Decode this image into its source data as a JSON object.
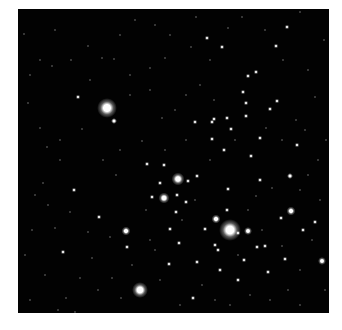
{
  "image": {
    "subject": "star cluster field",
    "background_color": "#020202",
    "frame_color": "#ffffff",
    "field": {
      "x": 18,
      "y": 9,
      "w": 311,
      "h": 304
    },
    "bright_stars": [
      [
        107,
        108,
        20
      ],
      [
        230,
        230,
        22
      ],
      [
        140,
        290,
        16
      ],
      [
        178,
        179,
        13
      ],
      [
        164,
        198,
        11
      ],
      [
        126,
        231,
        9
      ],
      [
        291,
        211,
        9
      ],
      [
        216,
        219,
        9
      ],
      [
        248,
        231,
        8
      ],
      [
        322,
        261,
        8
      ],
      [
        290,
        176,
        6
      ],
      [
        114,
        121,
        6
      ]
    ],
    "medium_stars": [
      [
        243,
        92
      ],
      [
        195,
        122
      ],
      [
        214,
        119
      ],
      [
        227,
        118
      ],
      [
        231,
        129
      ],
      [
        164,
        165
      ],
      [
        212,
        122
      ],
      [
        251,
        156
      ],
      [
        228,
        189
      ],
      [
        265,
        246
      ],
      [
        244,
        260
      ],
      [
        260,
        180
      ],
      [
        147,
        164
      ],
      [
        177,
        195
      ],
      [
        212,
        139
      ],
      [
        186,
        202
      ],
      [
        215,
        245
      ],
      [
        257,
        247
      ],
      [
        238,
        233
      ],
      [
        205,
        229
      ],
      [
        170,
        229
      ],
      [
        193,
        298
      ],
      [
        227,
        210
      ],
      [
        277,
        101
      ],
      [
        270,
        109
      ],
      [
        303,
        230
      ],
      [
        297,
        145
      ],
      [
        152,
        197
      ],
      [
        169,
        264
      ],
      [
        220,
        270
      ],
      [
        179,
        243
      ],
      [
        222,
        47
      ],
      [
        207,
        38
      ],
      [
        276,
        46
      ],
      [
        287,
        27
      ],
      [
        256,
        72
      ],
      [
        248,
        76
      ],
      [
        63,
        252
      ],
      [
        78,
        97
      ],
      [
        176,
        212
      ],
      [
        197,
        262
      ],
      [
        218,
        250
      ],
      [
        268,
        272
      ],
      [
        285,
        259
      ],
      [
        315,
        222
      ],
      [
        238,
        280
      ],
      [
        74,
        190
      ],
      [
        127,
        247
      ],
      [
        197,
        176
      ],
      [
        246,
        103
      ],
      [
        246,
        116
      ],
      [
        260,
        138
      ],
      [
        281,
        218
      ],
      [
        188,
        181
      ],
      [
        160,
        183
      ],
      [
        224,
        150
      ],
      [
        99,
        217
      ]
    ],
    "faint_stars": [
      [
        24,
        34
      ],
      [
        88,
        46
      ],
      [
        135,
        20
      ],
      [
        155,
        25
      ],
      [
        196,
        17
      ],
      [
        242,
        17
      ],
      [
        283,
        60
      ],
      [
        308,
        70
      ],
      [
        315,
        97
      ],
      [
        52,
        66
      ],
      [
        71,
        60
      ],
      [
        102,
        58
      ],
      [
        114,
        59
      ],
      [
        130,
        75
      ],
      [
        150,
        68
      ],
      [
        165,
        58
      ],
      [
        191,
        47
      ],
      [
        210,
        60
      ],
      [
        300,
        12
      ],
      [
        28,
        103
      ],
      [
        40,
        128
      ],
      [
        60,
        140
      ],
      [
        47,
        147
      ],
      [
        82,
        129
      ],
      [
        60,
        160
      ],
      [
        35,
        195
      ],
      [
        43,
        183
      ],
      [
        55,
        228
      ],
      [
        80,
        278
      ],
      [
        66,
        298
      ],
      [
        98,
        290
      ],
      [
        112,
        278
      ],
      [
        121,
        298
      ],
      [
        92,
        258
      ],
      [
        25,
        255
      ],
      [
        30,
        300
      ],
      [
        110,
        237
      ],
      [
        146,
        210
      ],
      [
        142,
        141
      ],
      [
        116,
        175
      ],
      [
        103,
        160
      ],
      [
        120,
        150
      ],
      [
        162,
        118
      ],
      [
        175,
        110
      ],
      [
        186,
        95
      ],
      [
        200,
        85
      ],
      [
        214,
        100
      ],
      [
        186,
        140
      ],
      [
        150,
        240
      ],
      [
        160,
        280
      ],
      [
        202,
        285
      ],
      [
        215,
        300
      ],
      [
        230,
        305
      ],
      [
        250,
        295
      ],
      [
        270,
        300
      ],
      [
        288,
        290
      ],
      [
        300,
        270
      ],
      [
        312,
        240
      ],
      [
        320,
        200
      ],
      [
        318,
        160
      ],
      [
        305,
        130
      ],
      [
        296,
        120
      ],
      [
        282,
        140
      ],
      [
        266,
        128
      ],
      [
        235,
        140
      ],
      [
        210,
        160
      ],
      [
        195,
        200
      ],
      [
        182,
        220
      ],
      [
        155,
        250
      ],
      [
        132,
        265
      ],
      [
        88,
        232
      ],
      [
        70,
        212
      ],
      [
        48,
        205
      ],
      [
        32,
        230
      ],
      [
        45,
        275
      ],
      [
        58,
        310
      ],
      [
        75,
        312
      ],
      [
        180,
        305
      ],
      [
        300,
        305
      ],
      [
        325,
        290
      ],
      [
        326,
        140
      ],
      [
        324,
        40
      ],
      [
        265,
        30
      ],
      [
        228,
        28
      ],
      [
        170,
        35
      ],
      [
        120,
        35
      ],
      [
        55,
        30
      ],
      [
        40,
        60
      ],
      [
        30,
        75
      ],
      [
        90,
        80
      ],
      [
        130,
        95
      ],
      [
        150,
        90
      ],
      [
        256,
        196
      ],
      [
        272,
        188
      ],
      [
        300,
        190
      ],
      [
        308,
        175
      ],
      [
        248,
        210
      ],
      [
        238,
        255
      ],
      [
        262,
        230
      ],
      [
        282,
        246
      ],
      [
        165,
        150
      ]
    ]
  }
}
